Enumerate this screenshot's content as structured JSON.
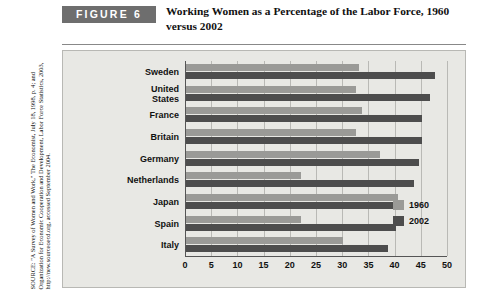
{
  "header": {
    "figure_badge": "FIGURE 6",
    "title": "Working Women as a Percentage of the Labor Force, 1960 versus 2002"
  },
  "source": {
    "note": "SOURCE: \"A Survey of Women and Work,\" The Economist, July 18, 1998, p. 4; and Organization for Economic Cooperation and Development, Labor Force Statistics, 2003, http://new.sourceoecd.org, accessed September 2004."
  },
  "colors": {
    "series_1960": "#9a9a97",
    "series_2002": "#4d4d4d",
    "panel_background": "#e8e8e4",
    "badge_background": "#6e6e6e",
    "gridline": "#b9b9b5"
  },
  "legend": {
    "position": "right-inside",
    "items": [
      {
        "label": "1960",
        "color": "#9a9a97"
      },
      {
        "label": "2002",
        "color": "#4d4d4d"
      }
    ]
  },
  "chart_data": {
    "type": "bar",
    "orientation": "horizontal",
    "title": "Working Women as a Percentage of the Labor Force, 1960 versus 2002",
    "xlabel": "",
    "ylabel": "",
    "xlim": [
      0,
      50
    ],
    "xticks": [
      0,
      5,
      10,
      15,
      20,
      25,
      30,
      35,
      40,
      45,
      50
    ],
    "grid": true,
    "categories": [
      "Sweden",
      "United States",
      "France",
      "Britain",
      "Germany",
      "Netherlands",
      "Japan",
      "Spain",
      "Italy"
    ],
    "series": [
      {
        "name": "1960",
        "color": "#9a9a97",
        "values": [
          33.0,
          32.5,
          33.5,
          32.5,
          37.0,
          22.0,
          40.5,
          22.0,
          30.0
        ]
      },
      {
        "name": "2002",
        "color": "#4d4d4d",
        "values": [
          47.5,
          46.5,
          45.0,
          45.0,
          44.5,
          43.5,
          41.0,
          40.0,
          38.5
        ]
      }
    ]
  }
}
